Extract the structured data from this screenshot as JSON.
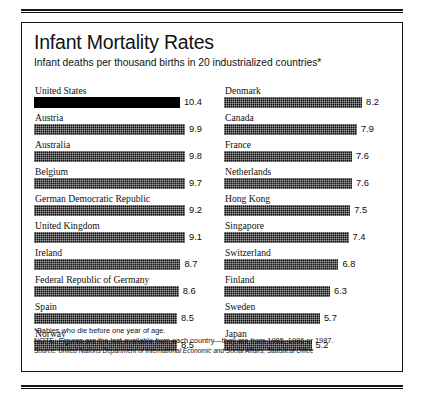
{
  "header": {
    "title": "Infant Mortality Rates",
    "subtitle": "Infant deaths per thousand births in 20 industrialized countries*"
  },
  "notes": {
    "footnote": "*Babies who die before one year of age.",
    "note": "NOTE: Figures are the last available from each country—they are from 1985, 1986 or 1987.",
    "source": "Source: United Nations Department of International Economic and Social Affairs, Statistical Office"
  },
  "chart_data": {
    "type": "bar",
    "title": "Infant Mortality Rates",
    "subtitle": "Infant deaths per thousand births in 20 industrialized countries*",
    "orientation": "horizontal",
    "xlabel": "",
    "ylabel": "",
    "xlim": [
      0,
      10.4
    ],
    "grid": false,
    "legend": false,
    "units": "deaths per thousand live births",
    "max_value": 10.4,
    "columns": [
      {
        "name": "left-column",
        "categories": [
          "United States",
          "Austria",
          "Australia",
          "Belgium",
          "German Democratic Republic",
          "United Kingdom",
          "Ireland",
          "Federal Republic of Germany",
          "Spain",
          "Norway"
        ],
        "values": [
          10.4,
          9.9,
          9.8,
          9.7,
          9.2,
          9.1,
          8.7,
          8.6,
          8.5,
          8.5
        ],
        "highlight": [
          true,
          false,
          false,
          false,
          false,
          false,
          false,
          false,
          false,
          false
        ]
      },
      {
        "name": "right-column",
        "categories": [
          "Denmark",
          "Canada",
          "France",
          "Netherlands",
          "Hong Kong",
          "Singapore",
          "Switzerland",
          "Finland",
          "Sweden",
          "Japan"
        ],
        "values": [
          8.2,
          7.9,
          7.6,
          7.6,
          7.5,
          7.4,
          6.8,
          6.3,
          5.7,
          5.2
        ],
        "highlight": [
          false,
          false,
          false,
          false,
          false,
          false,
          false,
          false,
          false,
          false
        ]
      }
    ]
  }
}
